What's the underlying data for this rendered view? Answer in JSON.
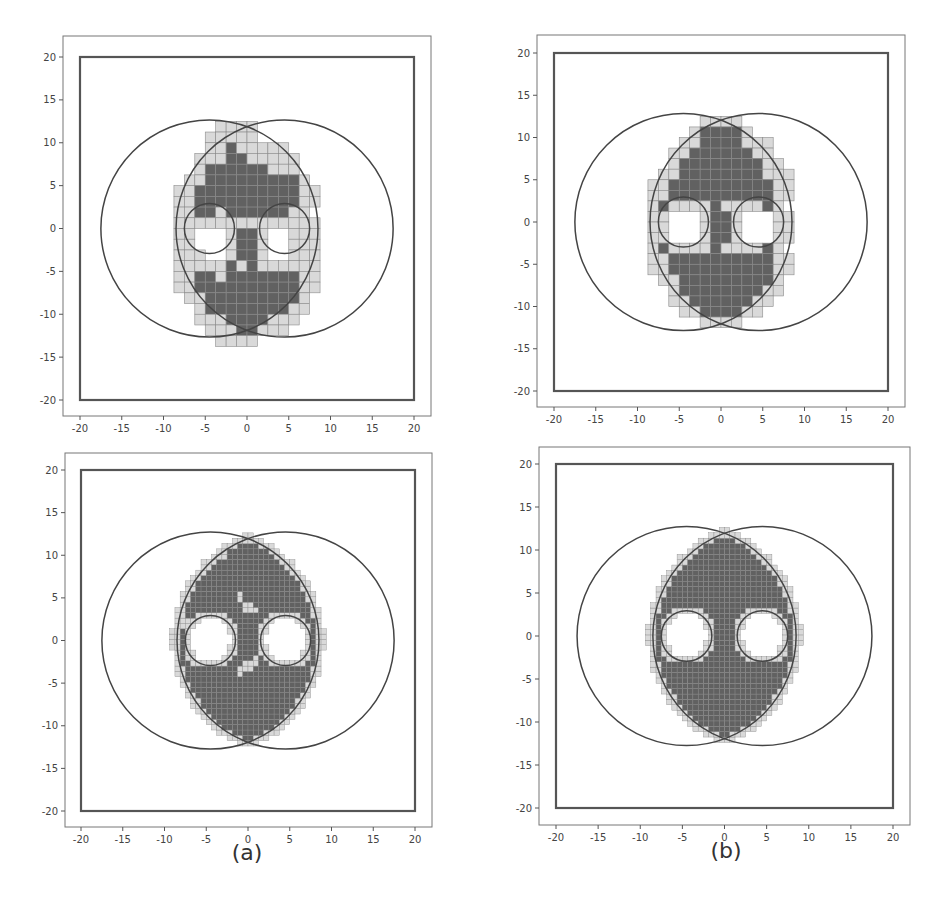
{
  "figure": {
    "captions": {
      "a": "(a)",
      "b": "(b)"
    }
  },
  "colors": {
    "dark_cell": "#616161",
    "light_cell": "#d9d9d9",
    "cell_edge": "#8a8a8a",
    "line": "#444444",
    "frame": "#555555"
  },
  "chart_data": [
    {
      "id": "top-left",
      "type": "heatmap",
      "title": "",
      "xlabel": "",
      "ylabel": "",
      "xlim": [
        -22,
        22
      ],
      "ylim": [
        -22,
        22
      ],
      "xticks": [
        -20,
        -15,
        -10,
        -5,
        0,
        5,
        10,
        15,
        20
      ],
      "yticks": [
        -20,
        -15,
        -10,
        -5,
        0,
        5,
        10,
        15,
        20
      ],
      "xtick_labels": [
        "-20",
        "-15",
        "-10",
        "-5",
        "0",
        "5",
        "10",
        "15",
        "20"
      ],
      "ytick_labels": [
        "-20",
        "-15",
        "-10",
        "-5",
        "0",
        "5",
        "10",
        "15",
        "20"
      ],
      "grid": false,
      "boundary_square": [
        -20,
        20
      ],
      "outer_circles": [
        {
          "cx": -4.5,
          "cy": 0,
          "r": 13
        },
        {
          "cx": 4.5,
          "cy": 0,
          "r": 13
        }
      ],
      "inner_circles": [
        {
          "cx": -4.5,
          "cy": 0,
          "r": 3
        },
        {
          "cx": 4.5,
          "cy": 0,
          "r": 3
        }
      ],
      "cell_size": 1.25,
      "grid_origin": [
        -8.75,
        12.5
      ],
      "cells": [
        "....llll......",
        "...lllll......",
        "...lldlllll...",
        "..lllddlllll..",
        "..lddddddlll..",
        ".lldddddddddl.",
        "llddddddddddll",
        "llddddddddddll",
        "llddlddddddll.",
        "llllllllllllll",
        "ll...lddl..lll",
        "ll...lddl..lll",
        "lll..lddl..lll",
        "llllldldllllll",
        "llddldddddddll",
        "llddddddddddll",
        ".lldddddddddl.",
        "..lddddddddll.",
        "..lllddddlll..",
        "...lllddlll...",
        "....llll......"
      ]
    },
    {
      "id": "top-right",
      "type": "heatmap",
      "title": "",
      "xlabel": "",
      "ylabel": "",
      "xlim": [
        -22,
        22
      ],
      "ylim": [
        -22,
        22
      ],
      "xticks": [
        -20,
        -15,
        -10,
        -5,
        0,
        5,
        10,
        15,
        20
      ],
      "yticks": [
        -20,
        -15,
        -10,
        -5,
        0,
        5,
        10,
        15,
        20
      ],
      "xtick_labels": [
        "-20",
        "-15",
        "-10",
        "-5",
        "0",
        "5",
        "10",
        "15",
        "20"
      ],
      "ytick_labels": [
        "-20",
        "-15",
        "-10",
        "-5",
        "0",
        "5",
        "10",
        "15",
        "20"
      ],
      "grid": false,
      "boundary_square": [
        -20,
        20
      ],
      "outer_circles": [
        {
          "cx": -4.5,
          "cy": 0,
          "r": 13
        },
        {
          "cx": 4.5,
          "cy": 0,
          "r": 13
        }
      ],
      "inner_circles": [
        {
          "cx": -4.5,
          "cy": 0,
          "r": 3
        },
        {
          "cx": 4.5,
          "cy": 0,
          "r": 3
        }
      ],
      "cell_size": 1.25,
      "grid_origin": [
        -8.75,
        12.5
      ],
      "cells": [
        ".....llll.....",
        "....lddddl....",
        "...llddddlll..",
        "..llddddddll..",
        "..lddddddddll.",
        ".llddddddddlll",
        "llddddddddddll",
        "llddddddddddll",
        "ldlllldlllldl.",
        "ll...lddl...ll",
        "ll...lddl...ll",
        "ll...lddl...ll",
        "ldlllldlllldl.",
        "llddddddddddll",
        "llddddddddddll",
        ".lldddddddddl.",
        "..lddddddddll.",
        "..llddddddll..",
        "...llddddll...",
        ".....llll....."
      ]
    },
    {
      "id": "bottom-left",
      "caption": "(a)",
      "type": "heatmap",
      "title": "",
      "xlabel": "",
      "ylabel": "",
      "xlim": [
        -22,
        22
      ],
      "ylim": [
        -22,
        22
      ],
      "xticks": [
        -20,
        -15,
        -10,
        -5,
        0,
        5,
        10,
        15,
        20
      ],
      "yticks": [
        -20,
        -15,
        -10,
        -5,
        0,
        5,
        10,
        15,
        20
      ],
      "xtick_labels": [
        "-20",
        "-15",
        "-10",
        "-5",
        "0",
        "5",
        "10",
        "15",
        "20"
      ],
      "ytick_labels": [
        "-20",
        "-15",
        "-10",
        "-5",
        "0",
        "5",
        "10",
        "15",
        "20"
      ],
      "grid": false,
      "boundary_square": [
        -20,
        20
      ],
      "outer_circles": [
        {
          "cx": -4.5,
          "cy": 0,
          "r": 13
        },
        {
          "cx": 4.5,
          "cy": 0,
          "r": 13
        }
      ],
      "inner_circles": [
        {
          "cx": -4.5,
          "cy": 0,
          "r": 3
        },
        {
          "cx": 4.5,
          "cy": 0,
          "r": 3
        }
      ],
      "cell_size": 0.625,
      "fill_region": "lens intersection of outer circles minus inner circles, dark with light boundary cells and a few scattered light cells",
      "scattered_light_points": [
        [
          -1,
          5
        ],
        [
          0,
          4
        ],
        [
          1,
          3.5
        ],
        [
          -1,
          -3.5
        ],
        [
          0,
          -3
        ],
        [
          1,
          -2.5
        ],
        [
          -7.5,
          2
        ],
        [
          -3,
          10
        ],
        [
          7,
          1
        ]
      ]
    },
    {
      "id": "bottom-right",
      "caption": "(b)",
      "type": "heatmap",
      "title": "",
      "xlabel": "",
      "ylabel": "",
      "xlim": [
        -22,
        22
      ],
      "ylim": [
        -22,
        22
      ],
      "xticks": [
        -20,
        -15,
        -10,
        -5,
        0,
        5,
        10,
        15,
        20
      ],
      "yticks": [
        -20,
        -15,
        -10,
        -5,
        0,
        5,
        10,
        15,
        20
      ],
      "xtick_labels": [
        "-20",
        "-15",
        "-10",
        "-5",
        "0",
        "5",
        "10",
        "15",
        "20"
      ],
      "ytick_labels": [
        "-20",
        "-15",
        "-10",
        "-5",
        "0",
        "5",
        "10",
        "15",
        "20"
      ],
      "grid": false,
      "boundary_square": [
        -20,
        20
      ],
      "outer_circles": [
        {
          "cx": -4.5,
          "cy": 0,
          "r": 13
        },
        {
          "cx": 4.5,
          "cy": 0,
          "r": 13
        }
      ],
      "inner_circles": [
        {
          "cx": -4.5,
          "cy": 0,
          "r": 3
        },
        {
          "cx": 4.5,
          "cy": 0,
          "r": 3
        }
      ],
      "cell_size": 0.625,
      "fill_region": "lens intersection of outer circles minus inner circles, solid dark with light boundary cells",
      "scattered_light_points": []
    }
  ],
  "layout": {
    "panels": [
      {
        "id": "top-left",
        "frame": [
          63,
          36,
          431,
          416
        ],
        "x_px": [
          80,
          414
        ],
        "y_px": [
          57,
          400
        ]
      },
      {
        "id": "top-right",
        "frame": [
          537,
          35,
          905,
          407
        ],
        "x_px": [
          554,
          888
        ],
        "y_px": [
          53,
          391
        ]
      },
      {
        "id": "bottom-left",
        "frame": [
          65,
          453,
          432,
          827
        ],
        "x_px": [
          81,
          415
        ],
        "y_px": [
          470,
          811
        ]
      },
      {
        "id": "bottom-right",
        "frame": [
          539,
          447,
          910,
          825
        ],
        "x_px": [
          556,
          893
        ],
        "y_px": [
          464,
          808
        ]
      }
    ],
    "captions": [
      {
        "id": "a",
        "x": 247,
        "y": 840
      },
      {
        "id": "b",
        "x": 726,
        "y": 838
      }
    ]
  }
}
